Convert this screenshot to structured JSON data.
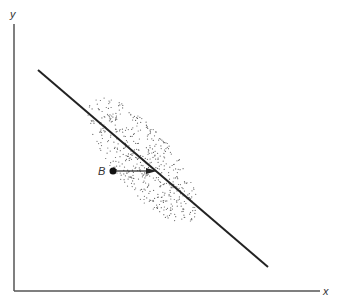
{
  "diagram": {
    "axes": {
      "x_label": "x",
      "y_label": "y"
    },
    "point_label": "B",
    "elements": [
      "regression line",
      "dotted elliptical scatter cloud",
      "point B",
      "horizontal arrow from B to line"
    ],
    "colors": {
      "ink": "#222222",
      "axis": "#555555",
      "dots": "#666666"
    }
  }
}
